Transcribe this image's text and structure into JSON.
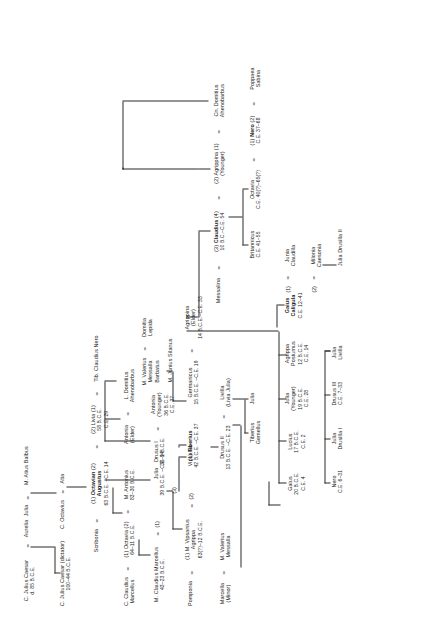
{
  "chart": {
    "type": "genealogy-tree",
    "orientation": "rotated-90-ccw",
    "marriage_symbol": "=",
    "line_color": "#2a2a2a",
    "text_color": "#1b1b1b"
  },
  "people": {
    "julius_caesar_sr": {
      "name": "C. Julius Caesar",
      "dates": "d. 85 B.C.E."
    },
    "aurelia": {
      "name": "Aurelia",
      "dates": ""
    },
    "julius_caesar_dict": {
      "name": "C. Julius Caesar (dictator)",
      "dates": "100–44 B.C.E."
    },
    "julia_balbus": {
      "name": "Julia",
      "dates": ""
    },
    "atius_balbus": {
      "name": "M. Atius Balbus",
      "dates": ""
    },
    "c_octavius": {
      "name": "C. Octavius",
      "dates": ""
    },
    "atia": {
      "name": "Atia",
      "dates": ""
    },
    "scribonia": {
      "name": "Scribonia",
      "dates": ""
    },
    "octavian": {
      "name_pre": "(1)",
      "name": "Octavian",
      "name_post": "(2)",
      "name2": "Augustus",
      "dates": "63 B.C.E. –C.E. 14"
    },
    "livia": {
      "name_pre": "(2)",
      "name": "Livia",
      "name_post": "(1)",
      "dates": "58 B.C.E.",
      "dates2": "C.E. 29"
    },
    "tib_claudius_nero": {
      "name": "Tib. Claudius Nero",
      "dates": ""
    },
    "c_claudius_marcellus": {
      "name": "C. Claudius",
      "name2": "Marcellus",
      "dates": ""
    },
    "octavia": {
      "name_pre": "(1)",
      "name": "Octavia",
      "name_post": "(2)",
      "dates": "64–11 B.C.E."
    },
    "m_antonius": {
      "name": "M. Antonius",
      "dates": "83–30 B.C.E."
    },
    "m_claudius_marcellus": {
      "name": "M. Claudius Marcellus",
      "dates": "43–23 B.C.E."
    },
    "julia_daughter": {
      "name": "Julia",
      "dates": "39 B.C.E. –C.E. 14"
    },
    "pomponia": {
      "name": "Pomponia",
      "dates": ""
    },
    "agrippa": {
      "name_pre": "(1)",
      "name": "M. Vipsanius",
      "name2": "Agrippa",
      "dates": "63(?)–12 B.C.E."
    },
    "vipsania": {
      "name": "Vipsania",
      "dates": ""
    },
    "marcella_minor": {
      "name": "Marcella",
      "name2": "(Minor)",
      "dates": ""
    },
    "m_valerius_messalla": {
      "name": "M. Valerius",
      "name2": "Messalla",
      "dates": ""
    },
    "antonia_elder": {
      "name": "Antonia",
      "name2": "(Elder)",
      "dates": ""
    },
    "l_domitius": {
      "name": "L. Domitius",
      "name2": "Ahenobarbus",
      "dates": ""
    },
    "drusus_i": {
      "name": "Drusus I",
      "dates": "38–9 B.C.E."
    },
    "antonia_younger": {
      "name": "Antonia",
      "name2": "(Younger)",
      "dates": "36 B.C.E.",
      "dates2": "C.E. 37"
    },
    "tiberius": {
      "name_pre": "(1)",
      "name": "Tiberius",
      "dates": "42 B.C.E. –C.E. 37"
    },
    "drusus_ii": {
      "name": "Drusus II",
      "dates": "13 B.C.E. –C.E. 23"
    },
    "livilla": {
      "name": "Livilla",
      "name2": "(Livia Julia)",
      "dates": ""
    },
    "tiberius_gemellus": {
      "name": "Tiberius",
      "name2": "Gemellus",
      "dates": ""
    },
    "julia_dii": {
      "name": "Julia",
      "dates": ""
    },
    "germanicus": {
      "name": "Germanicus",
      "dates": "15 B.C.E. –C.E. 19"
    },
    "agrippina_elder": {
      "name": "Agrippina",
      "name2": "(Elder)",
      "dates": "14 B.C.E.–C.E. 33"
    },
    "m_valerius_barbatus": {
      "name": "M. Valerius",
      "name2": "Messalla",
      "name3": "Barbatus"
    },
    "domitia_lepida": {
      "name": "Domitia",
      "name2": "Lepida",
      "dates": ""
    },
    "m_junius_silanus": {
      "name": "M. Junius Silanus",
      "dates": ""
    },
    "gaius_caesar": {
      "name": "Gaius",
      "dates": "20 B.C.E.",
      "dates2": "C.E. 4"
    },
    "lucius_caesar": {
      "name": "Lucius",
      "dates": "17 B.C.E.",
      "dates2": "C.E. 2"
    },
    "julia_younger": {
      "name": "Julia",
      "name2": "(Younger)",
      "dates": "19 B.C.E.",
      "dates2": "C.E. 28"
    },
    "agrippa_postumus": {
      "name": "Agrippa",
      "name2": "Postumus",
      "dates": "12 B.C.E.",
      "dates2": "C.E. 14"
    },
    "nero_son": {
      "name": "Nero",
      "dates": "C.E. 6–31"
    },
    "julia_drusilla_i": {
      "name": "Julia",
      "name2": "Drusilla I",
      "dates": ""
    },
    "drusus_iii": {
      "name": "Drusus III",
      "dates": "C.E. 7–33"
    },
    "julia_livilla": {
      "name": "Julia",
      "name2": "Livilla",
      "dates": ""
    },
    "caligula": {
      "name": "Gaius",
      "name2": "Caligula",
      "dates": "C.E. 12–41"
    },
    "junia_claudilla": {
      "name_pre": "(1)",
      "name": "Junia",
      "name2": "Claudilla",
      "dates": ""
    },
    "milonia_caesonia": {
      "name_pre": "(2)",
      "name": "Milonia",
      "name2": "Caesonia",
      "dates": ""
    },
    "julia_drusilla_ii": {
      "name": "Julia Drusilla II",
      "dates": ""
    },
    "messalina": {
      "name": "Messalina",
      "dates": ""
    },
    "claudius": {
      "name_pre": "(3)",
      "name": "Claudius",
      "name_post": "(4)",
      "dates": "10 B.C.–C.E. 54"
    },
    "agrippina_younger": {
      "name_pre": "(2)",
      "name": "Agrippina",
      "name_post": "(1)",
      "name2": "(Younger)",
      "dates": ""
    },
    "cn_domitius": {
      "name": "Cn. Domitius",
      "name2": "Ahenobarbus",
      "dates": ""
    },
    "britannicus": {
      "name": "Britannicus",
      "dates": "C.E. 41–55"
    },
    "octavia_claudia": {
      "name": "Octavia",
      "dates": "C.E. 40(?)–65(?)"
    },
    "nero_emperor": {
      "name_pre": "(1)",
      "name": "Nero",
      "name_post": "(2)",
      "dates": "C.E. 37–68"
    },
    "poppaea": {
      "name": "Poppaea",
      "name2": "Sabina",
      "dates": ""
    }
  }
}
